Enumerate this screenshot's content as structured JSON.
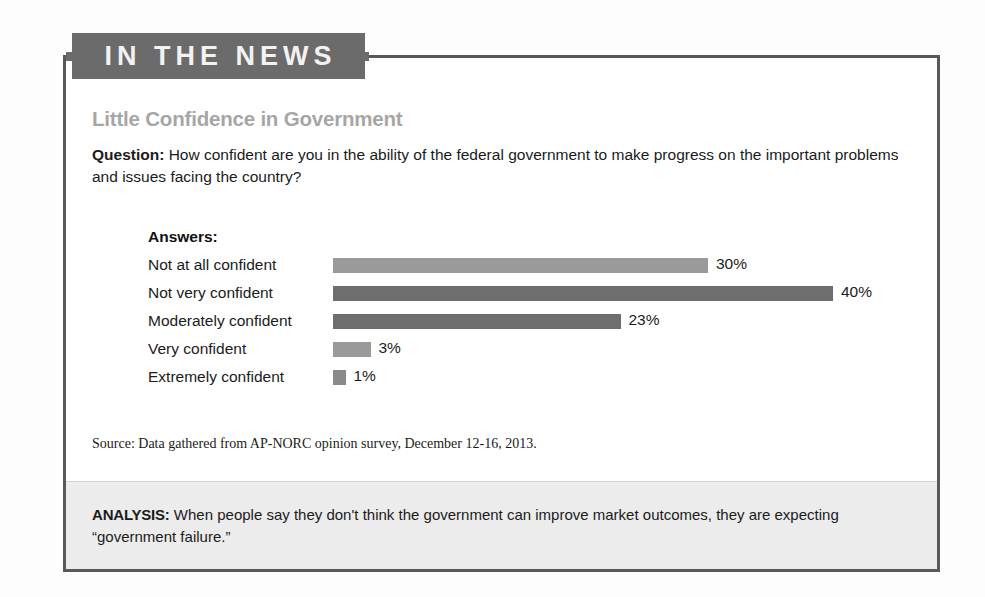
{
  "header": {
    "tab_label": "IN THE NEWS"
  },
  "article": {
    "title": "Little Confidence in Government",
    "question_label": "Question:",
    "question_text": "How confident are you in the ability of the federal government to make progress on the important problems and issues facing the country?",
    "answers_heading": "Answers:",
    "source": "Source: Data gathered from AP-NORC opinion survey, December 12-16, 2013.",
    "analysis_label": "ANALYSIS:",
    "analysis_text": "When people say they don't think the government can improve market outcomes, they are expecting “government failure.”"
  },
  "colors": {
    "tab_background": "#6b6b6b",
    "tab_text": "#f2f2f2",
    "box_border": "#595959",
    "title_gray": "#a6a6a6",
    "bar_light": "#9a9a9a",
    "bar_dark": "#6e6e6e",
    "analysis_band": "#ececec",
    "body_text": "#1b1b1b"
  },
  "chart_data": {
    "type": "bar",
    "orientation": "horizontal",
    "title": "Little Confidence in Government",
    "xlabel": "",
    "ylabel": "",
    "xlim": [
      0,
      50
    ],
    "grid": false,
    "legend": "none",
    "value_suffix": "%",
    "categories": [
      "Not at all confident",
      "Not very confident",
      "Moderately confident",
      "Very confident",
      "Extremely confident"
    ],
    "values": [
      30,
      40,
      23,
      3,
      1
    ],
    "value_labels": [
      "30%",
      "40%",
      "23%",
      "3%",
      "1%"
    ],
    "bar_colors": [
      "#9a9a9a",
      "#6e6e6e",
      "#6e6e6e",
      "#9a9a9a",
      "#8a8a8a"
    ],
    "px_per_unit": 12.5,
    "bars": [
      {
        "label": "Not at all confident",
        "value": 30,
        "value_label": "30%",
        "color": "#9a9a9a"
      },
      {
        "label": "Not very confident",
        "value": 40,
        "value_label": "40%",
        "color": "#6e6e6e"
      },
      {
        "label": "Moderately confident",
        "value": 23,
        "value_label": "23%",
        "color": "#6e6e6e"
      },
      {
        "label": "Very confident",
        "value": 3,
        "value_label": "3%",
        "color": "#9a9a9a"
      },
      {
        "label": "Extremely confident",
        "value": 1,
        "value_label": "1%",
        "color": "#8a8a8a"
      }
    ]
  }
}
